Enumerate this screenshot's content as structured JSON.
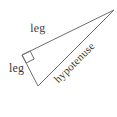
{
  "figure": {
    "name": "right-triangle-diagram",
    "background_color": "#ffffff",
    "stroke_color": "#6e6e6e",
    "text_color": "#3b3b3b",
    "labels": {
      "leg_upper": "leg",
      "leg_lower": "leg",
      "hypotenuse": "hypotenuse"
    },
    "vertices": {
      "right_angle": {
        "x": 22,
        "y": 55
      },
      "apex": {
        "x": 114,
        "y": 10
      },
      "bottom": {
        "x": 38,
        "y": 86
      }
    },
    "right_angle_marker": {
      "name": "right-angle-square",
      "size": 9
    },
    "sides": [
      {
        "name": "leg-upper",
        "from": "right_angle",
        "to": "apex",
        "label": "leg"
      },
      {
        "name": "leg-lower",
        "from": "right_angle",
        "to": "bottom",
        "label": "leg"
      },
      {
        "name": "hypotenuse",
        "from": "bottom",
        "to": "apex",
        "label": "hypotenuse"
      }
    ]
  }
}
